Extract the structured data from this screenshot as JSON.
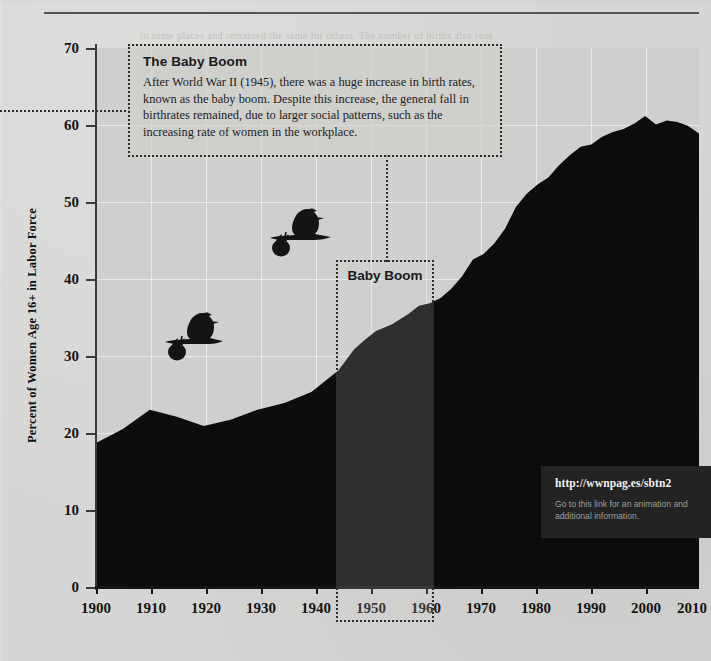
{
  "chart_data": {
    "type": "area",
    "title": "",
    "xlabel": "",
    "ylabel": "Percent of Women Age 16+ in Labor Force",
    "xlim": [
      1900,
      2012
    ],
    "ylim": [
      0,
      70
    ],
    "grid": true,
    "legend_position": "none",
    "x_ticks": [
      "1900",
      "1910",
      "1920",
      "1930",
      "1940",
      "1950",
      "1960",
      "1970",
      "1980",
      "1990",
      "2000",
      "2010"
    ],
    "y_ticks": [
      "0",
      "10",
      "20",
      "30",
      "40",
      "50",
      "60",
      "70"
    ],
    "series_name": "Percent of Women Age 16+ in Labor Force",
    "fill_color": "#0c0c0c",
    "x": [
      1900,
      1905,
      1910,
      1915,
      1920,
      1925,
      1930,
      1935,
      1940,
      1945,
      1948,
      1950,
      1952,
      1955,
      1958,
      1960,
      1962,
      1964,
      1966,
      1968,
      1970,
      1972,
      1974,
      1976,
      1978,
      1980,
      1982,
      1984,
      1986,
      1988,
      1990,
      1992,
      1994,
      1996,
      1998,
      2000,
      2002,
      2004,
      2006,
      2008,
      2010,
      2012
    ],
    "values": [
      18.8,
      20.6,
      23.1,
      22.2,
      21.0,
      21.8,
      23.1,
      24.0,
      25.4,
      28.2,
      31.0,
      32.2,
      33.3,
      34.2,
      35.5,
      36.6,
      36.9,
      37.6,
      38.8,
      40.4,
      42.6,
      43.3,
      44.7,
      46.6,
      49.4,
      51.1,
      52.3,
      53.2,
      54.8,
      56.1,
      57.2,
      57.5,
      58.5,
      59.1,
      59.5,
      60.2,
      61.2,
      60.1,
      60.6,
      60.4,
      59.9,
      58.9
    ],
    "peak_year": 2000,
    "peak_value": 61.2,
    "start_value": 18.8,
    "end_value": 58.9
  },
  "callout": {
    "title": "The Baby Boom",
    "body": "After World War II (1945), there was a huge increase in birth rates, known as the baby boom. Despite this increase, the general fall in birthrates remained, due to larger social patterns, such as the increasing rate of women in the workplace."
  },
  "band": {
    "label": "Baby Boom",
    "start_year": 1946,
    "end_year": 1964
  },
  "url_box": {
    "link": "http://wwnpag.es/sbtn2",
    "note": "Go to this link for an animation and additional information."
  },
  "annotations": {
    "stork_1": "stork-carrying-bundle",
    "stork_2": "stork-carrying-bundle"
  },
  "colors": {
    "page_background": "#d6d6d4",
    "plot_background": "#cfcfcd",
    "area_fill": "#0c0c0c",
    "axis": "#151515",
    "gridline": "#ffffff",
    "url_box_background": "#232323",
    "url_text": "#f2f2f2"
  }
}
